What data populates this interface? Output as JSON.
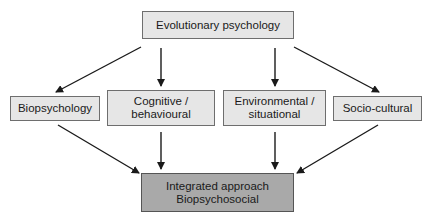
{
  "diagram": {
    "top": {
      "label": "Evolutionary psychology"
    },
    "middle": [
      {
        "label": "Biopsychology"
      },
      {
        "label": "Cognitive /\nbehavioural"
      },
      {
        "label": "Environmental /\nsituational"
      },
      {
        "label": "Socio-cultural"
      }
    ],
    "bottom": {
      "label": "Integrated approach\nBiopsychosocial"
    },
    "colors": {
      "box_fill": "#e6e6e6",
      "bottom_fill": "#a9a9a9",
      "arrow": "#1a1a1a"
    }
  }
}
